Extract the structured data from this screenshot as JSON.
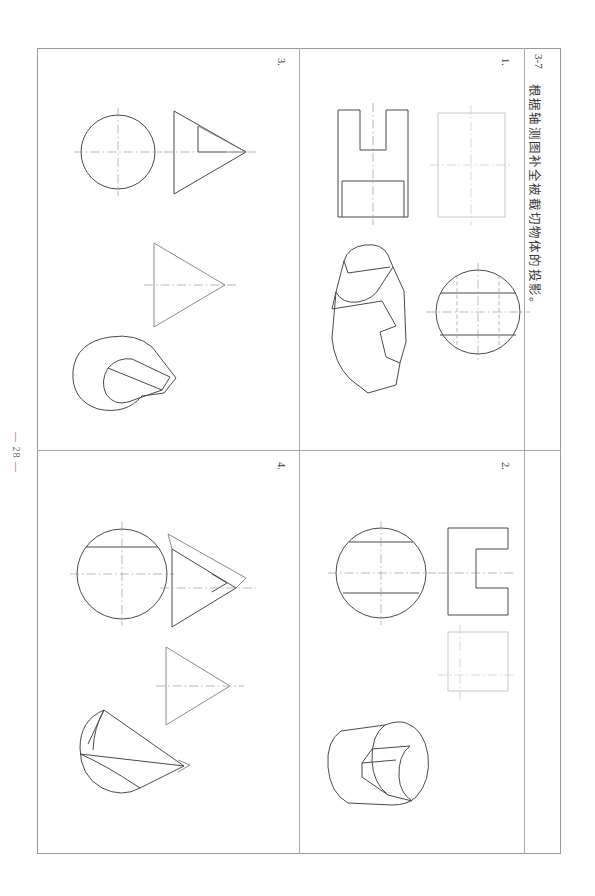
{
  "document": {
    "exercise_code": "3-7",
    "title": "根据轴测图补全被截切物体的投影。",
    "page_number": "— 28 —"
  },
  "problems": [
    {
      "number": "1.",
      "position": "top-right",
      "description": "Cut cylinder: front view with U-notch, light construction rectangle, isometric pictorial of notched cylinder, top view circle with hidden lines"
    },
    {
      "number": "2.",
      "position": "bottom-right",
      "description": "Horizontal cut cylinder: circle left view with two chords, C-shaped notched front view, light construction square, isometric pictorial"
    },
    {
      "number": "3.",
      "position": "top-left",
      "description": "Truncated cone: circle top view with centerlines, triangle front view with step cut, plain triangle side view, isometric pictorial of cone"
    },
    {
      "number": "4.",
      "position": "bottom-left",
      "description": "Cut cone: circle top view with chord, triangle front view with wedge cut, plain triangle side view, isometric pictorial of cut cone"
    }
  ],
  "colors": {
    "frame": "#9a9a9a",
    "line": "#4a4a4a",
    "light_line": "#c3c3c3",
    "center_line": "#9b9b9b",
    "hidden_line": "#a5a5a5",
    "text": "#3a3a3a",
    "page_background": "#ffffff"
  }
}
